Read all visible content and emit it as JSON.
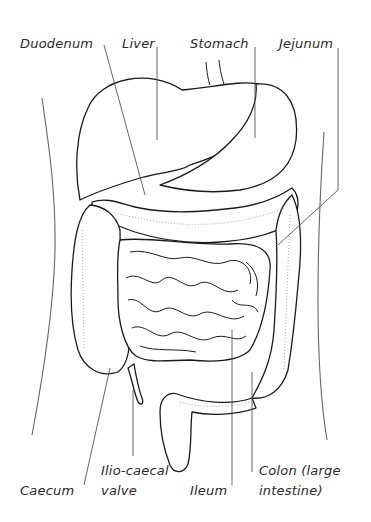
{
  "diagram": {
    "labels": {
      "duodenum": "Duodenum",
      "liver": "Liver",
      "stomach": "Stomach",
      "jejunum": "Jejunum",
      "caecum": "Caecum",
      "ilio_caecal_line1": "Ilio-caecal",
      "ilio_caecal_line2": "valve",
      "ileum": "Ileum",
      "colon_line1": "Colon (large",
      "colon_line2": "intestine)"
    },
    "colors": {
      "background": "#ffffff",
      "outline": "#1a1a1a",
      "leader": "#555555",
      "text": "#2a2a2a"
    }
  }
}
